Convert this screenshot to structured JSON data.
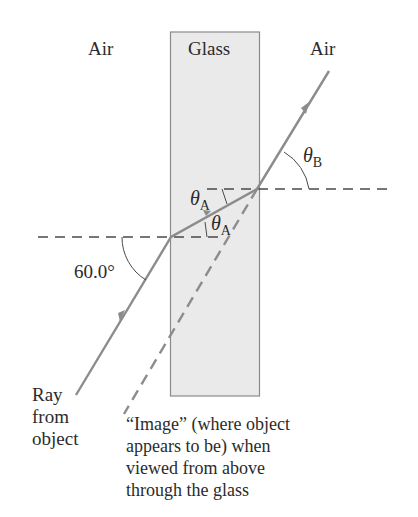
{
  "labels": {
    "air_left": "Air",
    "glass": "Glass",
    "air_right": "Air",
    "theta": "θ",
    "sub_a": "A",
    "sub_b": "B",
    "angle_incident": "60.0°",
    "ray_source": [
      "Ray",
      "from",
      "object"
    ],
    "image_caption": [
      "“Image” (where object",
      "appears to be) when",
      "viewed from above",
      "through the glass"
    ]
  },
  "colors": {
    "glass_fill": "#eaeaea",
    "glass_border": "#8a8a8a",
    "ray": "#8c8c8c",
    "dashed": "#4a4a4a",
    "text": "#2b2b2b"
  }
}
